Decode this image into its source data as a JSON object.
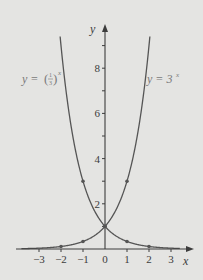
{
  "chart_data": {
    "type": "line",
    "title": "",
    "xlabel": "x",
    "ylabel": "y",
    "xlim": [
      -3.8,
      3.4
    ],
    "ylim": [
      0,
      9.6
    ],
    "x_ticks": [
      -3,
      -2,
      -1,
      0,
      1,
      2,
      3
    ],
    "x_tick_labels": [
      "−3",
      "−2",
      "−1",
      "0",
      "1",
      "2",
      "3"
    ],
    "y_ticks": [
      1,
      2,
      3,
      4,
      5,
      6,
      7,
      8,
      9
    ],
    "y_tick_labels": [
      "2",
      "4",
      "6",
      "8"
    ],
    "y_labeled_ticks": [
      2,
      4,
      6,
      8
    ],
    "grid": false,
    "legend": "inline labels",
    "series": [
      {
        "name": "y = (1/3)^x",
        "label_text": "y = (1/3)^x",
        "x": [
          -2,
          -1,
          0,
          1,
          2
        ],
        "values": [
          9,
          3,
          1,
          0.333,
          0.111
        ],
        "marked_points": [
          [
            -1,
            3
          ],
          [
            0,
            1
          ],
          [
            1,
            0.333
          ],
          [
            2,
            0.111
          ]
        ]
      },
      {
        "name": "y = 3^x",
        "label_text": "y = 3^x",
        "x": [
          -2,
          -1,
          0,
          1,
          2
        ],
        "values": [
          0.111,
          0.333,
          1,
          3,
          9
        ],
        "marked_points": [
          [
            -2,
            0.111
          ],
          [
            -1,
            0.333
          ],
          [
            0,
            1
          ],
          [
            1,
            3
          ]
        ]
      }
    ]
  },
  "labels": {
    "y_axis": "y",
    "x_axis": "x",
    "left_curve_prefix": "y = ",
    "left_curve_num": "1",
    "left_curve_den": "3",
    "left_curve_exp": "x",
    "right_curve_prefix": "y = 3",
    "right_curve_exp": "x"
  },
  "colors": {
    "background": "#e4e4e2",
    "curve": "#555555",
    "axis": "#3c3c3c",
    "label": "#777777"
  }
}
